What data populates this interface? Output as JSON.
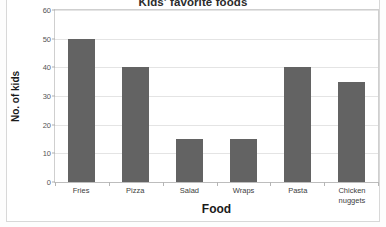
{
  "chart_data": {
    "type": "bar",
    "title": "Kids' favorite foods",
    "xlabel": "Food",
    "ylabel": "No. of kids",
    "categories": [
      "Fries",
      "Pizza",
      "Salad",
      "Wraps",
      "Pasta",
      "Chicken nuggets"
    ],
    "values": [
      50,
      40,
      15,
      15,
      40,
      35
    ],
    "ylim": [
      0,
      60
    ],
    "yticks": [
      0,
      10,
      20,
      30,
      40,
      50,
      60
    ],
    "ytick_labels": [
      "0",
      "10",
      "20",
      "30",
      "40",
      "50",
      "60"
    ],
    "grid": true,
    "legend": false,
    "orientation": "vertical",
    "bar_color": "#636363",
    "gridline_color": "#e4e4e4",
    "plot_border_color": "#cfcfcf",
    "frame_color": "#d8d8d8",
    "background_color": "#ffffff",
    "title_clipped": true
  }
}
